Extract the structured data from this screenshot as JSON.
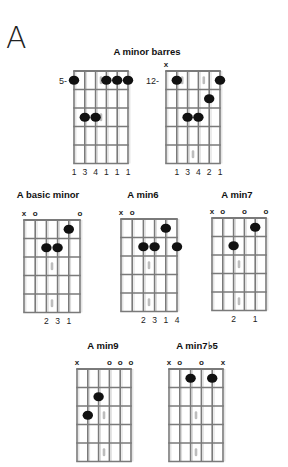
{
  "page": {
    "letter": "A",
    "group_title": "A minor barres"
  },
  "style": {
    "line_color": "#7a7a7a",
    "dot_color": "#111111",
    "marker_color": "#bdbdbd",
    "text_color": "#222222"
  },
  "chords": [
    {
      "id": "barre-5",
      "title": "",
      "x": 74,
      "y": 71,
      "width": 54,
      "fret_height": 18.5,
      "frets": 5,
      "strings": 6,
      "fret_label": "5-",
      "fret_label_row": 1,
      "open_muted": [
        "",
        "",
        "",
        "",
        "",
        ""
      ],
      "dots": [
        {
          "string": 0,
          "fret": 1
        },
        {
          "string": 3,
          "fret": 1
        },
        {
          "string": 4,
          "fret": 1
        },
        {
          "string": 5,
          "fret": 1
        },
        {
          "string": 1,
          "fret": 3
        },
        {
          "string": 2,
          "fret": 3
        }
      ],
      "fingers": [
        "1",
        "3",
        "4",
        "1",
        "1",
        "1"
      ],
      "markers": [
        {
          "between": 2.5,
          "fret": 1
        },
        {
          "between": 2.5,
          "fret": 3
        }
      ]
    },
    {
      "id": "barre-12",
      "title": "",
      "x": 166,
      "y": 71,
      "width": 54,
      "fret_height": 18.5,
      "frets": 5,
      "strings": 6,
      "fret_label": "12-",
      "fret_label_row": 1,
      "open_muted": [
        "x",
        "",
        "",
        "",
        "",
        ""
      ],
      "dots": [
        {
          "string": 1,
          "fret": 1
        },
        {
          "string": 5,
          "fret": 1
        },
        {
          "string": 4,
          "fret": 2
        },
        {
          "string": 2,
          "fret": 3
        },
        {
          "string": 3,
          "fret": 3
        }
      ],
      "fingers": [
        "",
        "1",
        "3",
        "4",
        "2",
        "1"
      ],
      "markers": [
        {
          "between": 1.5,
          "fret": 1
        },
        {
          "between": 3.5,
          "fret": 1
        },
        {
          "between": 2.5,
          "fret": 5
        }
      ]
    },
    {
      "id": "basic-minor",
      "title": "A basic minor",
      "title_x": 48,
      "title_y": 196,
      "x": 24,
      "y": 220,
      "width": 56,
      "fret_height": 18.5,
      "frets": 5,
      "strings": 6,
      "fret_label": "",
      "open_muted": [
        "x",
        "o",
        "",
        "",
        "",
        "o"
      ],
      "dots": [
        {
          "string": 4,
          "fret": 1
        },
        {
          "string": 2,
          "fret": 2
        },
        {
          "string": 3,
          "fret": 2
        }
      ],
      "fingers": [
        "",
        "",
        "2",
        "3",
        "1",
        ""
      ],
      "markers": [
        {
          "between": 2.5,
          "fret": 3
        },
        {
          "between": 2.5,
          "fret": 5
        }
      ]
    },
    {
      "id": "min6",
      "title": "A min6",
      "title_x": 143,
      "title_y": 196,
      "x": 121,
      "y": 219,
      "width": 56,
      "fret_height": 18.5,
      "frets": 5,
      "strings": 6,
      "fret_label": "",
      "open_muted": [
        "x",
        "o",
        "",
        "",
        "",
        ""
      ],
      "dots": [
        {
          "string": 4,
          "fret": 1
        },
        {
          "string": 2,
          "fret": 2
        },
        {
          "string": 3,
          "fret": 2
        },
        {
          "string": 5,
          "fret": 2
        }
      ],
      "fingers": [
        "",
        "",
        "2",
        "3",
        "1",
        "4"
      ],
      "markers": [
        {
          "between": 2.5,
          "fret": 3
        },
        {
          "between": 2.5,
          "fret": 5
        }
      ]
    },
    {
      "id": "min7",
      "title": "A min7",
      "title_x": 237,
      "title_y": 196,
      "x": 212,
      "y": 218,
      "width": 54,
      "fret_height": 18.5,
      "frets": 5,
      "strings": 6,
      "fret_label": "",
      "open_muted": [
        "x",
        "o",
        "",
        "o",
        "",
        "o"
      ],
      "dots": [
        {
          "string": 4,
          "fret": 1
        },
        {
          "string": 2,
          "fret": 2
        }
      ],
      "fingers": [
        "",
        "",
        "2",
        "",
        "1",
        ""
      ],
      "markers": [
        {
          "between": 2.5,
          "fret": 3
        },
        {
          "between": 2.5,
          "fret": 5
        }
      ]
    },
    {
      "id": "min9",
      "title": "A min9",
      "title_x": 103,
      "title_y": 347,
      "x": 77,
      "y": 369,
      "width": 54,
      "fret_height": 18.5,
      "frets": 5,
      "strings": 6,
      "fret_label": "",
      "open_muted": [
        "x",
        "",
        "",
        "o",
        "o",
        "o"
      ],
      "dots": [
        {
          "string": 2,
          "fret": 2
        },
        {
          "string": 1,
          "fret": 3
        }
      ],
      "fingers": [],
      "markers": [
        {
          "between": 2.5,
          "fret": 3
        },
        {
          "between": 2.5,
          "fret": 5
        }
      ]
    },
    {
      "id": "min7b5",
      "title": "A min7♭5",
      "title_x": 197,
      "title_y": 347,
      "x": 169,
      "y": 369,
      "width": 54,
      "fret_height": 18.5,
      "frets": 5,
      "strings": 6,
      "fret_label": "",
      "open_muted": [
        "x",
        "o",
        "",
        "o",
        "",
        "x"
      ],
      "dots": [
        {
          "string": 2,
          "fret": 1
        },
        {
          "string": 4,
          "fret": 1
        }
      ],
      "fingers": [],
      "markers": [
        {
          "between": 2.5,
          "fret": 3
        },
        {
          "between": 2.5,
          "fret": 5
        }
      ]
    }
  ]
}
